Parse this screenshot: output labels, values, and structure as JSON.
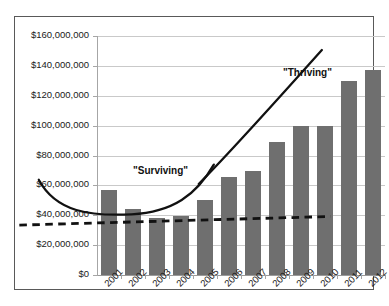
{
  "chart_data": {
    "type": "bar",
    "title": "",
    "subtitle": "",
    "xlabel": "",
    "ylabel": "",
    "categories": [
      "2001",
      "2002",
      "2003",
      "2004",
      "2005",
      "2006",
      "2007",
      "2008",
      "2009",
      "2010",
      "2011",
      "2012"
    ],
    "values": [
      57000000,
      44000000,
      38500000,
      39500000,
      50000000,
      65500000,
      69500000,
      89000000,
      100000000,
      100000000,
      130000000,
      137000000
    ],
    "series": [
      {
        "name": "Annual Amount",
        "values": [
          57000000,
          44000000,
          38500000,
          39500000,
          50000000,
          65500000,
          69500000,
          89000000,
          100000000,
          100000000,
          130000000,
          137000000
        ]
      }
    ],
    "ylim": [
      0,
      160000000
    ],
    "ytick_values": [
      0,
      20000000,
      40000000,
      60000000,
      80000000,
      100000000,
      120000000,
      140000000,
      160000000
    ],
    "ytick_labels": [
      "$0",
      "$20,000,000",
      "$40,000,000",
      "$60,000,000",
      "$80,000,000",
      "$100,000,000",
      "$120,000,000",
      "$140,000,000",
      "$160,000,000"
    ],
    "grid": true,
    "legend": "none",
    "bar_color": "#6f6f6f",
    "annotations": [
      {
        "name": "surviving",
        "label": "\"Surviving\"",
        "style": "solid-curve",
        "color": "#111111",
        "description": "Solid U-shaped curve tracing the flat period 2001-2006 then turning upward"
      },
      {
        "name": "thriving",
        "label": "\"Thriving\"",
        "style": "solid-curve",
        "color": "#111111",
        "description": "Solid rising curve from 2005 through 2012 showing strong growth"
      },
      {
        "name": "trendline",
        "label": "",
        "style": "dashed-line",
        "color": "#111111",
        "description": "Nearly flat dashed trendline hovering just above $40,000,000 across all years"
      }
    ]
  }
}
